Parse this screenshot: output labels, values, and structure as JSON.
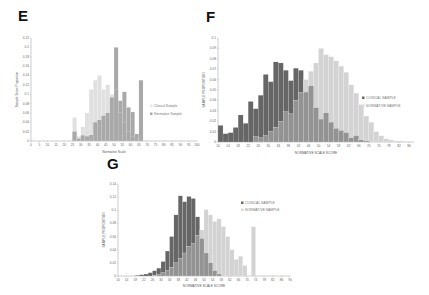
{
  "panels": {
    "E": {
      "letter": "E"
    },
    "F": {
      "letter": "F"
    },
    "G": {
      "letter": "G"
    }
  },
  "chart_data": [
    {
      "panel": "E",
      "type": "bar",
      "title": "",
      "xlabel": "Normative Scale",
      "ylabel": "Sample Score Proportion",
      "xlim": [
        0,
        100
      ],
      "ylim": [
        0,
        0.22
      ],
      "xticks": [
        0,
        5,
        10,
        15,
        20,
        25,
        30,
        35,
        40,
        45,
        50,
        55,
        60,
        65,
        70,
        75,
        80,
        85,
        90,
        95,
        100
      ],
      "yticks": [
        0,
        0.02,
        0.04,
        0.06,
        0.08,
        0.1,
        0.12,
        0.14,
        0.16,
        0.18,
        0.2,
        0.22
      ],
      "bin_width": 2.5,
      "legend": [
        "Clinical Sample",
        "Normative Sample"
      ],
      "legend_position": "right",
      "grid": false,
      "series": [
        {
          "name": "Clinical Sample",
          "color": "#e0e0e0",
          "x": [
            25,
            27.5,
            30,
            32.5,
            35,
            37.5,
            40,
            42.5,
            45,
            47.5,
            50,
            52.5,
            55,
            57.5,
            60,
            62.5,
            65
          ],
          "values": [
            0.05,
            0.01,
            0.03,
            0.06,
            0.11,
            0.13,
            0.14,
            0.11,
            0.12,
            0.1,
            0.11,
            0.06,
            0.04,
            0.02,
            0.01,
            0.0,
            0.0
          ]
        },
        {
          "name": "Normative Sample",
          "color": "#a9a9a9",
          "x": [
            25,
            27.5,
            30,
            32.5,
            35,
            37.5,
            40,
            42.5,
            45,
            47.5,
            50,
            52.5,
            55,
            57.5,
            60,
            62.5,
            65
          ],
          "values": [
            0.02,
            0.005,
            0.012,
            0.01,
            0.013,
            0.04,
            0.045,
            0.054,
            0.06,
            0.093,
            0.2,
            0.086,
            0.105,
            0.072,
            0.062,
            0.015,
            0.005,
            0.13
          ]
        }
      ]
    },
    {
      "panel": "F",
      "type": "bar",
      "title": "",
      "xlabel": "NORMATIVE SCALE SCORE",
      "ylabel": "SAMPLE PROPORTION",
      "xlim": [
        10,
        88
      ],
      "ylim": [
        0,
        0.1
      ],
      "xticks": [
        10,
        14,
        18,
        22,
        26,
        30,
        34,
        38,
        42,
        46,
        50,
        54,
        58,
        62,
        66,
        70,
        74,
        78,
        82,
        86
      ],
      "yticks": [
        0,
        0.01,
        0.02,
        0.03,
        0.04,
        0.05,
        0.06,
        0.07,
        0.08,
        0.09,
        0.1
      ],
      "bin_width": 2,
      "legend": [
        "CLINICAL SAMPLE",
        "NORMATIVE SAMPLE"
      ],
      "legend_position": "right",
      "grid": false,
      "series": [
        {
          "name": "CLINICAL SAMPLE",
          "color": "#666666",
          "x": [
            10,
            12,
            14,
            16,
            18,
            20,
            22,
            24,
            26,
            28,
            30,
            32,
            34,
            36,
            38,
            40,
            42,
            44,
            46,
            48,
            50,
            52,
            54,
            56,
            58,
            60,
            62,
            64,
            66,
            68,
            70,
            72,
            74
          ],
          "values": [
            0.016,
            0.008,
            0.009,
            0.014,
            0.026,
            0.018,
            0.039,
            0.032,
            0.045,
            0.065,
            0.058,
            0.077,
            0.076,
            0.069,
            0.059,
            0.071,
            0.069,
            0.048,
            0.054,
            0.033,
            0.022,
            0.028,
            0.019,
            0.013,
            0.011,
            0.009,
            0.004,
            0.006,
            0.002,
            0.001,
            0,
            0,
            0
          ]
        },
        {
          "name": "NORMATIVE SAMPLE",
          "color": "#d3d3d3",
          "x": [
            10,
            12,
            14,
            16,
            18,
            20,
            22,
            24,
            26,
            28,
            30,
            32,
            34,
            36,
            38,
            40,
            42,
            44,
            46,
            48,
            50,
            52,
            54,
            56,
            58,
            60,
            62,
            64,
            66,
            68,
            70,
            72,
            74,
            76,
            78,
            80,
            82,
            84
          ],
          "values": [
            0,
            0,
            0,
            0,
            0,
            0,
            0,
            0.005,
            0.004,
            0.006,
            0.01,
            0.014,
            0.02,
            0.029,
            0.027,
            0.04,
            0.048,
            0.06,
            0.068,
            0.076,
            0.09,
            0.084,
            0.082,
            0.078,
            0.073,
            0.067,
            0.055,
            0.047,
            0.036,
            0.025,
            0.019,
            0.01,
            0.006,
            0.003,
            0.002,
            0.001,
            0.001,
            0.0005
          ]
        }
      ]
    },
    {
      "panel": "G",
      "type": "bar",
      "title": "",
      "xlabel": "NORMATIVE SCALE SCORE",
      "ylabel": "SAMPLE PROPORTION",
      "xlim": [
        10,
        90
      ],
      "ylim": [
        0,
        0.14
      ],
      "xticks": [
        10,
        14,
        18,
        22,
        26,
        30,
        34,
        38,
        42,
        46,
        50,
        54,
        58,
        62,
        66,
        70,
        74,
        78,
        82,
        86,
        90
      ],
      "yticks": [
        0,
        0.02,
        0.04,
        0.06,
        0.08,
        0.1,
        0.12,
        0.14
      ],
      "bin_width": 2,
      "legend": [
        "CLINICAL SAMPLE",
        "NORMATIVE SAMPLE"
      ],
      "legend_position": "upper right",
      "grid": false,
      "series": [
        {
          "name": "CLINICAL SAMPLE",
          "color": "#666666",
          "x": [
            18,
            20,
            22,
            24,
            26,
            28,
            30,
            32,
            34,
            36,
            38,
            40,
            42,
            44,
            46,
            48,
            50,
            52,
            54,
            56
          ],
          "values": [
            0.001,
            0.002,
            0.003,
            0.005,
            0.008,
            0.012,
            0.022,
            0.038,
            0.06,
            0.093,
            0.122,
            0.113,
            0.121,
            0.118,
            0.09,
            0.057,
            0.035,
            0.02,
            0.008,
            0.003
          ]
        },
        {
          "name": "NORMATIVE SAMPLE",
          "color": "#d3d3d3",
          "x": [
            26,
            28,
            30,
            32,
            34,
            36,
            38,
            40,
            42,
            44,
            46,
            48,
            50,
            52,
            54,
            56,
            58,
            60,
            62,
            64,
            66,
            68,
            70,
            72
          ],
          "values": [
            0.001,
            0.002,
            0.005,
            0.008,
            0.013,
            0.02,
            0.027,
            0.035,
            0.045,
            0.05,
            0.062,
            0.07,
            0.101,
            0.093,
            0.083,
            0.087,
            0.075,
            0.06,
            0.04,
            0.025,
            0.03,
            0.016,
            0.0,
            0.075
          ]
        }
      ]
    }
  ]
}
